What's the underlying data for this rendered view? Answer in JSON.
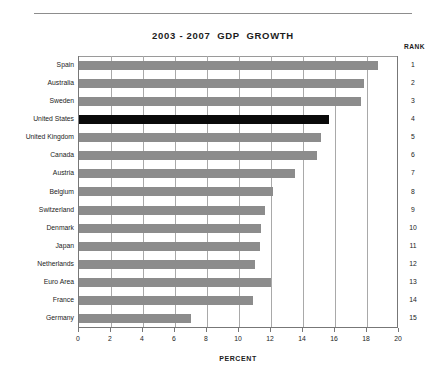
{
  "header": {
    "title": "2003 - 2007  GDP  GROWTH",
    "rank_column_header": "RANK"
  },
  "axis": {
    "x_title": "PERCENT",
    "x_ticks": [
      "0",
      "2",
      "4",
      "6",
      "8",
      "10",
      "12",
      "14",
      "16",
      "18",
      "20"
    ]
  },
  "colors": {
    "bar": "#8c8c8c",
    "highlight_bar": "#0a0a0a",
    "gridline": "#a9a9a9",
    "axis": "#777777",
    "text": "#1c1c1c",
    "background": "#ffffff"
  },
  "chart_data": {
    "type": "bar",
    "orientation": "horizontal",
    "title": "2003 - 2007  GDP  GROWTH",
    "xlabel": "PERCENT",
    "ylabel": "",
    "xlim": [
      0,
      20
    ],
    "xticks": [
      0,
      2,
      4,
      6,
      8,
      10,
      12,
      14,
      16,
      18,
      20
    ],
    "grid": true,
    "grid_axis": "x",
    "legend": false,
    "highlight_category": "United States",
    "rank_column": "RANK",
    "categories": [
      "Spain",
      "Australia",
      "Sweden",
      "United States",
      "United Kingdom",
      "Canada",
      "Austria",
      "Belgium",
      "Switzerland",
      "Denmark",
      "Japan",
      "Netherlands",
      "Euro Area",
      "France",
      "Germany"
    ],
    "ranks": [
      1,
      2,
      3,
      4,
      5,
      6,
      7,
      8,
      9,
      10,
      11,
      12,
      13,
      14,
      15
    ],
    "values": [
      18.7,
      17.8,
      17.6,
      15.6,
      15.1,
      14.9,
      13.5,
      12.1,
      11.6,
      11.4,
      11.3,
      11.0,
      12.0,
      10.9,
      7.0
    ],
    "series": [
      {
        "name": "GDP Growth 2003-2007",
        "values": [
          18.7,
          17.8,
          17.6,
          15.6,
          15.1,
          14.9,
          13.5,
          12.1,
          11.6,
          11.4,
          11.3,
          11.0,
          12.0,
          10.9,
          7.0
        ]
      }
    ],
    "bars": [
      {
        "rank": 1,
        "category": "Spain",
        "value": 18.7,
        "highlighted": false
      },
      {
        "rank": 2,
        "category": "Australia",
        "value": 17.8,
        "highlighted": false
      },
      {
        "rank": 3,
        "category": "Sweden",
        "value": 17.6,
        "highlighted": false
      },
      {
        "rank": 4,
        "category": "United States",
        "value": 15.6,
        "highlighted": true
      },
      {
        "rank": 5,
        "category": "United Kingdom",
        "value": 15.1,
        "highlighted": false
      },
      {
        "rank": 6,
        "category": "Canada",
        "value": 14.9,
        "highlighted": false
      },
      {
        "rank": 7,
        "category": "Austria",
        "value": 13.5,
        "highlighted": false
      },
      {
        "rank": 8,
        "category": "Belgium",
        "value": 12.1,
        "highlighted": false
      },
      {
        "rank": 9,
        "category": "Switzerland",
        "value": 11.6,
        "highlighted": false
      },
      {
        "rank": 10,
        "category": "Denmark",
        "value": 11.4,
        "highlighted": false
      },
      {
        "rank": 11,
        "category": "Japan",
        "value": 11.3,
        "highlighted": false
      },
      {
        "rank": 12,
        "category": "Netherlands",
        "value": 11.0,
        "highlighted": false
      },
      {
        "rank": 13,
        "category": "Euro Area",
        "value": 12.0,
        "highlighted": false
      },
      {
        "rank": 14,
        "category": "France",
        "value": 10.9,
        "highlighted": false
      },
      {
        "rank": 15,
        "category": "Germany",
        "value": 7.0,
        "highlighted": false
      }
    ]
  }
}
